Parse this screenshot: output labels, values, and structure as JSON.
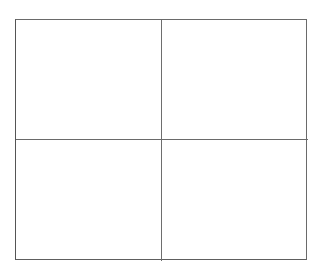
{
  "document": {
    "type": "quadrant-grid",
    "title": "",
    "background_color": "#ffffff",
    "line_color": "#6a6a6a",
    "canvas": {
      "width": 323,
      "height": 271
    }
  },
  "grid": {
    "columns": 2,
    "rows": 2,
    "cell_count": 4,
    "frame": {
      "left": 15,
      "top": 19,
      "width": 292,
      "height": 241
    },
    "dividers": {
      "vertical_x": 161,
      "horizontal_y": 139
    },
    "cells": [
      {
        "id": "top-left",
        "row": 0,
        "col": 0,
        "text": ""
      },
      {
        "id": "top-right",
        "row": 0,
        "col": 1,
        "text": ""
      },
      {
        "id": "bottom-left",
        "row": 1,
        "col": 0,
        "text": ""
      },
      {
        "id": "bottom-right",
        "row": 1,
        "col": 1,
        "text": ""
      }
    ]
  }
}
